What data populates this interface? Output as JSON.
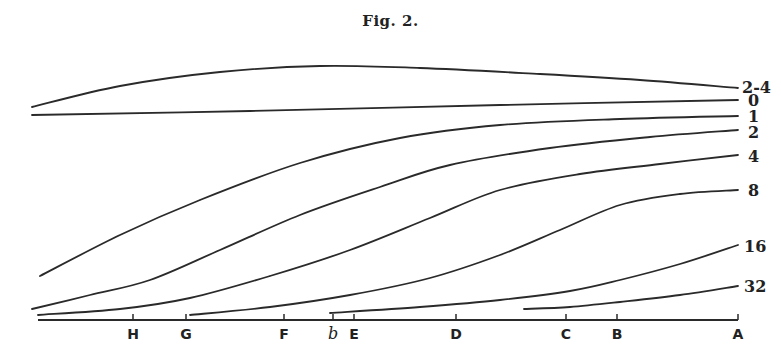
{
  "figure": {
    "title": "Fig. 2."
  },
  "chart_data": {
    "type": "line",
    "title": "Fig. 2.",
    "xlabel": "",
    "ylabel": "",
    "grid": false,
    "legend_position": "inline-right",
    "x_axis": {
      "tick_labels": [
        "H",
        "G",
        "F",
        "b",
        "E",
        "D",
        "C",
        "B",
        "A"
      ],
      "tick_positions_px": [
        133,
        186,
        284,
        333,
        354,
        456,
        566,
        617,
        738
      ]
    },
    "series": [
      {
        "name": "2-4",
        "label_pos": [
          742,
          93
        ],
        "points": [
          [
            32,
            107
          ],
          [
            120,
            86
          ],
          [
            220,
            72
          ],
          [
            320,
            66
          ],
          [
            420,
            68
          ],
          [
            540,
            74
          ],
          [
            640,
            80
          ],
          [
            738,
            88
          ]
        ]
      },
      {
        "name": "0",
        "label_pos": [
          748,
          106
        ],
        "points": [
          [
            32,
            115
          ],
          [
            250,
            111
          ],
          [
            500,
            105
          ],
          [
            738,
            100
          ]
        ]
      },
      {
        "name": "1",
        "label_pos": [
          748,
          122
        ],
        "points": [
          [
            40,
            276
          ],
          [
            120,
            235
          ],
          [
            200,
            200
          ],
          [
            300,
            163
          ],
          [
            400,
            138
          ],
          [
            500,
            125
          ],
          [
            620,
            119
          ],
          [
            738,
            116
          ]
        ]
      },
      {
        "name": "2",
        "label_pos": [
          748,
          138
        ],
        "points": [
          [
            32,
            309
          ],
          [
            90,
            295
          ],
          [
            150,
            280
          ],
          [
            220,
            250
          ],
          [
            300,
            215
          ],
          [
            380,
            187
          ],
          [
            450,
            165
          ],
          [
            550,
            148
          ],
          [
            650,
            137
          ],
          [
            738,
            130
          ]
        ]
      },
      {
        "name": "4",
        "label_pos": [
          748,
          162
        ],
        "points": [
          [
            38,
            315
          ],
          [
            120,
            309
          ],
          [
            190,
            298
          ],
          [
            270,
            276
          ],
          [
            350,
            250
          ],
          [
            430,
            218
          ],
          [
            500,
            190
          ],
          [
            580,
            174
          ],
          [
            660,
            164
          ],
          [
            738,
            155
          ]
        ]
      },
      {
        "name": "8",
        "label_pos": [
          748,
          196
        ],
        "points": [
          [
            190,
            315
          ],
          [
            270,
            307
          ],
          [
            350,
            295
          ],
          [
            430,
            278
          ],
          [
            500,
            255
          ],
          [
            560,
            230
          ],
          [
            620,
            205
          ],
          [
            680,
            194
          ],
          [
            738,
            190
          ]
        ]
      },
      {
        "name": "16",
        "label_pos": [
          744,
          252
        ],
        "points": [
          [
            330,
            313
          ],
          [
            420,
            307
          ],
          [
            500,
            300
          ],
          [
            570,
            291
          ],
          [
            620,
            280
          ],
          [
            680,
            264
          ],
          [
            738,
            245
          ]
        ]
      },
      {
        "name": "32",
        "label_pos": [
          744,
          292
        ],
        "points": [
          [
            524,
            309
          ],
          [
            570,
            307
          ],
          [
            620,
            302
          ],
          [
            680,
            295
          ],
          [
            738,
            286
          ]
        ]
      }
    ],
    "axis_line": {
      "x_start": 38,
      "x_end": 738,
      "y": 320
    }
  }
}
